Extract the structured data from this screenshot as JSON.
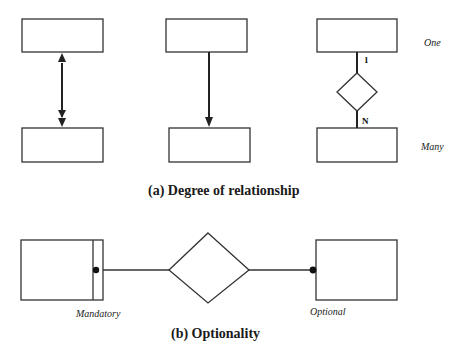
{
  "diagram": {
    "part_a": {
      "caption": "(a) Degree of relationship",
      "right_labels": {
        "top": "One",
        "bottom": "Many"
      },
      "cardinality": {
        "top": "1",
        "bottom": "N"
      }
    },
    "part_b": {
      "caption": "(b) Optionality",
      "labels": {
        "left": "Mandatory",
        "right": "Optional"
      }
    },
    "colors": {
      "stroke": "#222222",
      "background": "#ffffff"
    }
  }
}
